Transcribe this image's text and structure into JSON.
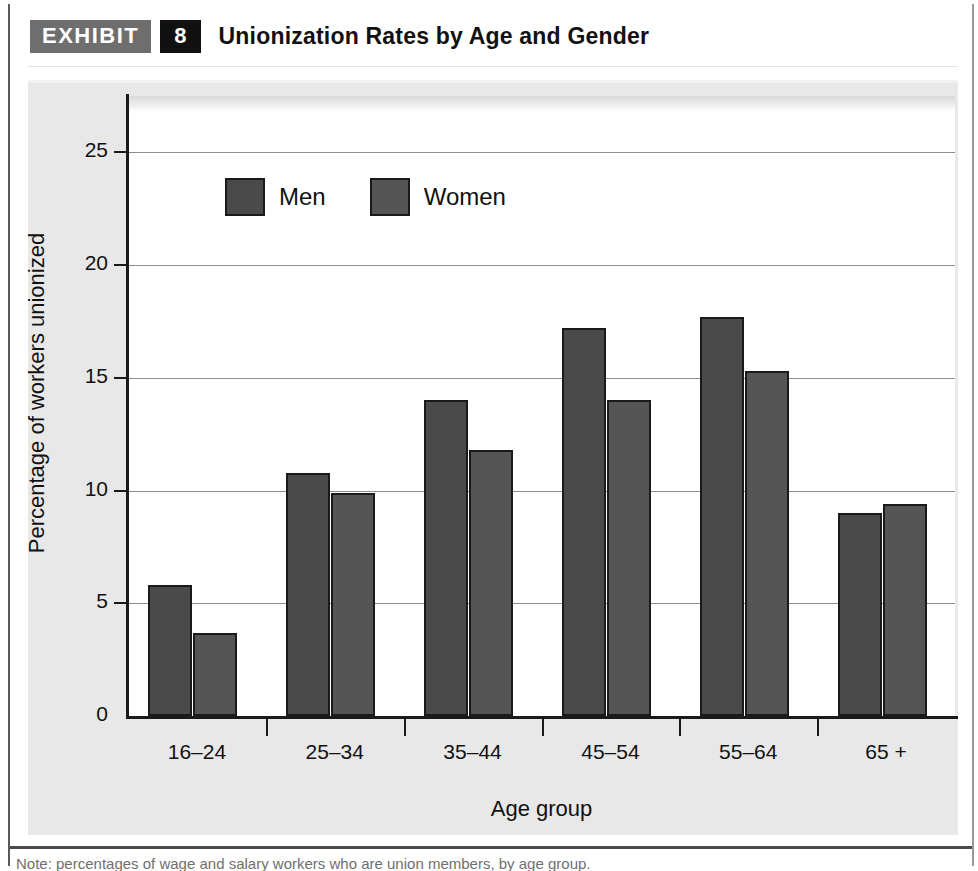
{
  "header": {
    "exhibit_label": "EXHIBIT",
    "exhibit_number": "8",
    "title": "Unionization Rates by Age and Gender"
  },
  "colors": {
    "men_bar": "#4a4a4a",
    "women_bar": "#555555",
    "bar_outline": "#1a1a1a",
    "panel_background": "#e8e8e8",
    "plot_background": "#ffffff",
    "gridline": "#8d8d8d",
    "exhibit_tag_background": "#6e6e6e",
    "exhibit_number_background": "#111111"
  },
  "legend": {
    "position": "top-left-inside",
    "items": [
      {
        "label": "Men",
        "color": "#4a4a4a"
      },
      {
        "label": "Women",
        "color": "#555555"
      }
    ]
  },
  "chart_data": {
    "type": "bar",
    "title": "Unionization Rates by Age and Gender",
    "xlabel": "Age group",
    "ylabel": "Percentage of workers unionized",
    "categories": [
      "16–24",
      "25–34",
      "35–44",
      "45–54",
      "55–64",
      "65 +"
    ],
    "series": [
      {
        "name": "Men",
        "values": [
          5.8,
          10.8,
          14.0,
          17.2,
          17.7,
          9.0
        ]
      },
      {
        "name": "Women",
        "values": [
          3.7,
          9.9,
          11.8,
          14.0,
          15.3,
          9.4
        ]
      }
    ],
    "ylim": [
      0,
      27.5
    ],
    "yticks": [
      0,
      5,
      10,
      15,
      20,
      25
    ],
    "ytick_labels": [
      "0",
      "5",
      "10",
      "15",
      "20",
      "25"
    ],
    "grid": true,
    "grid_axis": "y",
    "legend_position": "upper left"
  },
  "caption": {
    "text": "Note: percentages of wage and salary workers who are union members, by age group."
  }
}
